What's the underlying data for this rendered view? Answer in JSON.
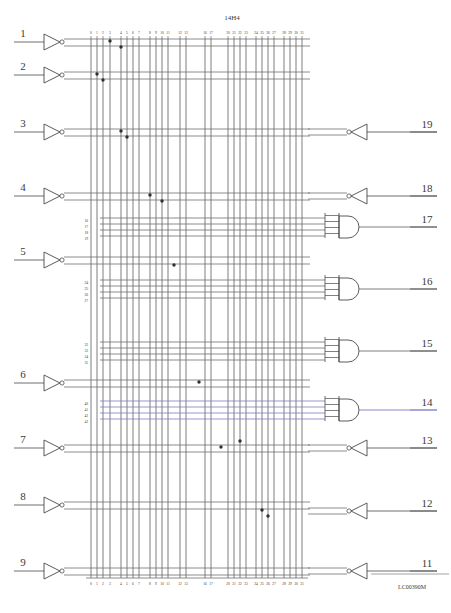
{
  "document": {
    "title": "14H4",
    "corner_code": "LC00390M",
    "figure_type": "PAL/PLA logic array fuse map diagram"
  },
  "bus": {
    "top_labels": [
      "0",
      "1",
      "2",
      "3",
      "4",
      "5",
      "6",
      "7",
      "8",
      "9",
      "10",
      "11",
      "12",
      "13",
      "16",
      "17",
      "20",
      "21",
      "22",
      "23",
      "24",
      "25",
      "26",
      "27",
      "28",
      "29",
      "30",
      "31"
    ],
    "bottom_labels": [
      "0",
      "1",
      "2",
      "3",
      "4",
      "5",
      "6",
      "7",
      "8",
      "9",
      "10",
      "11",
      "12",
      "13",
      "16",
      "17",
      "20",
      "21",
      "22",
      "23",
      "24",
      "25",
      "26",
      "27",
      "28",
      "29",
      "30",
      "31"
    ],
    "column_x": [
      91,
      97,
      103,
      110,
      121,
      127,
      133,
      139,
      150,
      156,
      162,
      168,
      180,
      186,
      205,
      211,
      228,
      234,
      240,
      246,
      256,
      262,
      268,
      274,
      284,
      290,
      296,
      302
    ]
  },
  "inputs": [
    {
      "pin": "1",
      "y": 41,
      "name": "input-pin-1"
    },
    {
      "pin": "2",
      "y": 74,
      "name": "input-pin-2"
    },
    {
      "pin": "3",
      "y": 131,
      "name": "input-pin-3"
    },
    {
      "pin": "4",
      "y": 195,
      "name": "input-pin-4"
    },
    {
      "pin": "5",
      "y": 259,
      "name": "input-pin-5"
    },
    {
      "pin": "6",
      "y": 382,
      "name": "input-pin-6"
    },
    {
      "pin": "7",
      "y": 447,
      "name": "input-pin-7"
    },
    {
      "pin": "8",
      "y": 504,
      "name": "input-pin-8"
    },
    {
      "pin": "9",
      "y": 570,
      "name": "input-pin-9"
    }
  ],
  "outputs": [
    {
      "pin": "19",
      "y": 131,
      "type": "inverting-buffer",
      "name": "output-pin-19"
    },
    {
      "pin": "18",
      "y": 195,
      "type": "inverting-buffer",
      "name": "output-pin-18"
    },
    {
      "pin": "17",
      "y": 227,
      "type": "and-gate",
      "name": "output-pin-17"
    },
    {
      "pin": "16",
      "y": 289,
      "type": "and-gate",
      "name": "output-pin-16"
    },
    {
      "pin": "15",
      "y": 351,
      "type": "and-gate",
      "name": "output-pin-15"
    },
    {
      "pin": "14",
      "y": 410,
      "type": "and-gate",
      "name": "output-pin-14",
      "highlight_color": "#7b7bc8"
    },
    {
      "pin": "13",
      "y": 447,
      "type": "inverting-buffer",
      "name": "output-pin-13"
    },
    {
      "pin": "12",
      "y": 510,
      "type": "inverting-buffer",
      "name": "output-pin-12"
    },
    {
      "pin": "11",
      "y": 570,
      "type": "inverting-buffer",
      "name": "output-pin-11"
    }
  ],
  "product_term_groups": [
    {
      "gate_pin": "17",
      "labels": [
        "16",
        "17",
        "18",
        "19"
      ],
      "x": 88,
      "y_start": 222,
      "name": "product-terms-17"
    },
    {
      "gate_pin": "16",
      "labels": [
        "24",
        "25",
        "26",
        "27"
      ],
      "x": 88,
      "y_start": 284,
      "name": "product-terms-16"
    },
    {
      "gate_pin": "15",
      "labels": [
        "32",
        "33",
        "34",
        "35"
      ],
      "x": 88,
      "y_start": 346,
      "name": "product-terms-15"
    },
    {
      "gate_pin": "14",
      "labels": [
        "40",
        "41",
        "42",
        "43"
      ],
      "x": 88,
      "y_start": 405,
      "name": "product-terms-14"
    }
  ],
  "junction_dots": [
    {
      "x": 110,
      "y": 41
    },
    {
      "x": 121,
      "y": 47
    },
    {
      "x": 97,
      "y": 74
    },
    {
      "x": 103,
      "y": 80
    },
    {
      "x": 121,
      "y": 131
    },
    {
      "x": 127,
      "y": 137
    },
    {
      "x": 150,
      "y": 195
    },
    {
      "x": 162,
      "y": 201
    },
    {
      "x": 174,
      "y": 265
    },
    {
      "x": 199,
      "y": 382
    },
    {
      "x": 221,
      "y": 447
    },
    {
      "x": 240,
      "y": 441
    },
    {
      "x": 262,
      "y": 510
    },
    {
      "x": 268,
      "y": 516
    }
  ],
  "caption": "14H4 — PAL/PLA Logic Diagram"
}
